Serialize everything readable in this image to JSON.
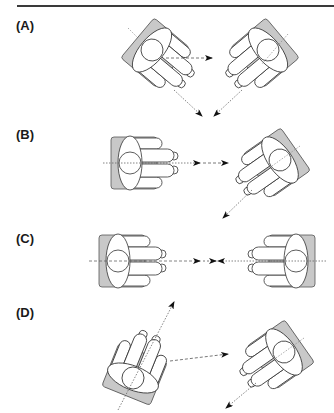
{
  "figure": {
    "panels": [
      {
        "label": "(A)",
        "top": 18,
        "description": "Two seated persons angled toward each other; gaze lines converge at a shared point below"
      },
      {
        "label": "(B)",
        "top": 127,
        "description": "Left person faces right toward the other; right person is angled away, gaze down-left"
      },
      {
        "label": "(C)",
        "top": 231,
        "description": "Two seated persons directly facing each other; gaze arrows meet in the middle"
      },
      {
        "label": "(D)",
        "top": 305,
        "description": "Left person looks up-right while arrow points toward right person; right person looks down-left"
      }
    ],
    "colors": {
      "seat": "#c8c8c8",
      "outline": "#333333",
      "body_fill": "#ffffff",
      "gaze_line": "#555555",
      "rule": "#3a3a3a"
    }
  }
}
